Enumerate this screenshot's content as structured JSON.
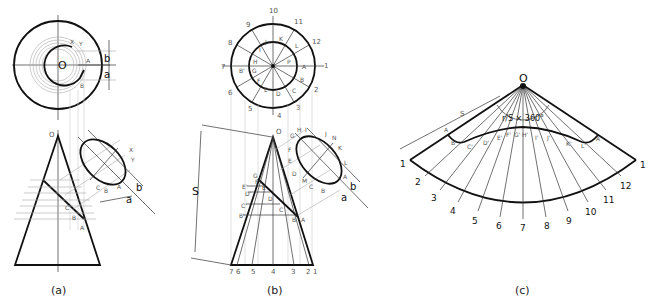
{
  "figure": {
    "panels": [
      {
        "id": "a",
        "caption": "(a)",
        "top_view_labels": {
          "center": "O",
          "point_a": "A",
          "point_b": "B",
          "point_x": "X",
          "point_y": "Y",
          "dim_b": "b",
          "dim_a": "a"
        },
        "front_view_labels": {
          "apex": "O",
          "point_a": "A",
          "point_b": "B",
          "point_c": "C"
        },
        "aux_view_labels": {
          "x": "X",
          "y": "Y",
          "a": "A",
          "b": "B",
          "c": "C",
          "dim_b": "b",
          "dim_a": "a"
        }
      },
      {
        "id": "b",
        "caption": "(b)",
        "top_view_numbers": [
          "1",
          "2",
          "3",
          "4",
          "5",
          "6",
          "7",
          "8",
          "9",
          "10",
          "11",
          "12"
        ],
        "top_view_letters": [
          "A",
          "B",
          "C",
          "D",
          "E",
          "F",
          "G",
          "H",
          "I",
          "J",
          "K",
          "L",
          "B'",
          "P"
        ],
        "front_view_apex": "O",
        "slant_label": "S",
        "front_view_letters": [
          "G",
          "F'",
          "E'",
          "D'",
          "C'",
          "B'",
          "E",
          "D",
          "C",
          "B",
          "A"
        ],
        "base_numbers": [
          "7",
          "6",
          "5",
          "4",
          "3",
          "2",
          "1"
        ],
        "aux_view_labels": [
          "G",
          "H",
          "I",
          "J",
          "N",
          "K",
          "L",
          "F",
          "E",
          "D",
          "M",
          "C",
          "B",
          "A"
        ],
        "dim_b": "b",
        "dim_a": "a"
      },
      {
        "id": "c",
        "caption": "(c)",
        "apex": "O",
        "slant_label": "S",
        "angle_formula": "r/S × 360°",
        "curve_labels": [
          "A",
          "B'",
          "C'",
          "D'",
          "E'",
          "F'",
          "G'",
          "H'",
          "I'",
          "J'",
          "K'",
          "L'",
          "A"
        ],
        "arc_numbers": [
          "1",
          "2",
          "3",
          "4",
          "5",
          "6",
          "7",
          "8",
          "9",
          "10",
          "11",
          "12",
          "1"
        ]
      }
    ]
  }
}
